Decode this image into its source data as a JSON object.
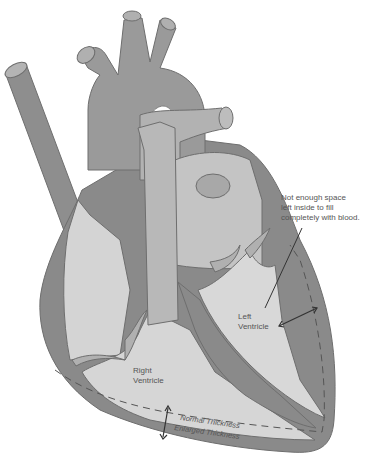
{
  "diagram": {
    "labels": {
      "note_line1": "Not enough space",
      "note_line2": "left inside to fill",
      "note_line3": "completely with blood.",
      "left_ventricle_line1": "Left",
      "left_ventricle_line2": "Ventricle",
      "right_ventricle_line1": "Right",
      "right_ventricle_line2": "Ventricle",
      "normal_thickness": "Normal Thickness",
      "enlarged_thickness": "Enlarged Thickness"
    },
    "colors": {
      "background": "#ffffff",
      "wall_dark": "#8a8a8a",
      "vessel_mid": "#9c9c9c",
      "chamber_light": "#d6d6d6",
      "vessel_light": "#b4b4b4",
      "outline": "#6e6e6e",
      "text": "#555555"
    }
  }
}
